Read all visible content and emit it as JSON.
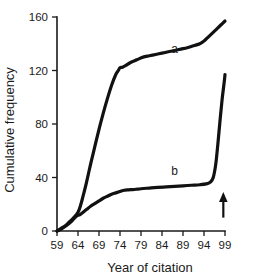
{
  "chart_data": {
    "type": "line",
    "title": "",
    "subtitle": "",
    "xlabel": "Year of citation",
    "ylabel": "Cumulative frequency",
    "xlim": [
      59,
      99
    ],
    "ylim": [
      0,
      160
    ],
    "xticks": [
      59,
      64,
      69,
      74,
      79,
      84,
      89,
      94,
      99
    ],
    "xtick_labels": [
      "59",
      "64",
      "69",
      "74",
      "79",
      "84",
      "89",
      "94",
      "99"
    ],
    "yticks": [
      0,
      40,
      80,
      120,
      160
    ],
    "ytick_labels": [
      "0",
      "40",
      "80",
      "120",
      "160"
    ],
    "grid": false,
    "legend": "none",
    "series": [
      {
        "name": "a",
        "label": "a",
        "label_x": 87,
        "label_y": 133,
        "color": "#111111",
        "x": [
          59,
          60,
          61,
          62,
          63,
          64,
          64.6,
          65.2,
          66,
          67,
          68,
          69,
          70,
          71,
          72,
          73,
          73.6,
          74,
          74.6,
          75.5,
          76.5,
          78,
          79.5,
          81,
          82.5,
          84,
          85.5,
          87,
          88.5,
          90,
          91.5,
          93,
          94,
          95,
          96,
          97,
          98,
          99
        ],
        "y": [
          0,
          2,
          4,
          7,
          10,
          14,
          19,
          26,
          36,
          50,
          63,
          76,
          88,
          99,
          109,
          117,
          120,
          122,
          122.5,
          124,
          126,
          128,
          130,
          131,
          132,
          133,
          134,
          135,
          136,
          137,
          138.5,
          140,
          142,
          145,
          148,
          151,
          154,
          157
        ]
      },
      {
        "name": "b",
        "label": "b",
        "label_x": 87,
        "label_y": 42,
        "color": "#111111",
        "x": [
          59,
          60,
          61,
          62,
          63,
          63.8,
          64.4,
          65,
          66,
          67,
          68,
          69,
          70,
          71,
          72,
          73,
          74,
          75,
          76,
          77,
          77.8,
          79,
          81,
          83,
          85,
          87,
          89,
          91,
          93,
          94.5,
          95.5,
          96.2,
          96.8,
          97.3,
          97.8,
          98.3,
          98.8,
          99
        ],
        "y": [
          0,
          1.5,
          3.5,
          6,
          9,
          11.5,
          12,
          13.5,
          16,
          18.5,
          20.5,
          22.5,
          24.5,
          26,
          27.5,
          28.5,
          29.5,
          30.5,
          30.8,
          31,
          31.2,
          31.6,
          32.1,
          32.6,
          33,
          33.4,
          33.8,
          34.2,
          34.6,
          35.2,
          36.5,
          40,
          50,
          65,
          82,
          98,
          111,
          117
        ]
      }
    ],
    "annotations": [
      {
        "name": "up-arrow",
        "type": "arrow",
        "x": 98.6,
        "y_tail": 10,
        "y_head": 27,
        "direction": "up"
      }
    ]
  }
}
